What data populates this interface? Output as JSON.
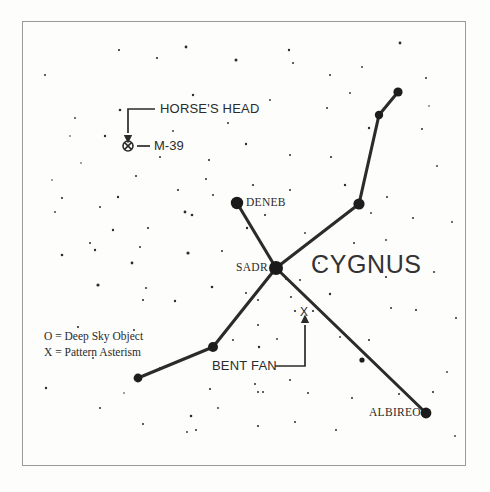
{
  "chart": {
    "title": "CYGNUS",
    "frame": {
      "x": 22,
      "y": 21,
      "width": 443,
      "height": 444,
      "color": "#9a9a9a"
    },
    "background_color": "#fdfdfc",
    "ink_color": "#2b2b2b"
  },
  "legend": {
    "line1": "O = Deep Sky Object",
    "line2": "X = Pattern Asterism"
  },
  "labels": {
    "cygnus": "CYGNUS",
    "deneb": "DENEB",
    "sadr": "SADR",
    "albireo": "ALBIREO",
    "m39": "M-39",
    "horses_head": "HORSE'S HEAD",
    "bent_fan": "BENT FAN",
    "asterism_marker": "X"
  },
  "chart_data": {
    "type": "scatter",
    "title": "CYGNUS",
    "xlabel": "",
    "ylabel": "",
    "xlim": [
      0,
      490
    ],
    "ylim": [
      0,
      492
    ],
    "grid": false,
    "legend_position": "lower-left",
    "named_stars": [
      {
        "name": "DENEB",
        "x": 237,
        "y": 203,
        "radius": 6.2
      },
      {
        "name": "SADR",
        "x": 276,
        "y": 268,
        "radius": 7.0
      },
      {
        "name": "ALBIREO",
        "x": 426,
        "y": 413,
        "radius": 5.4
      }
    ],
    "pattern_stars": [
      {
        "name": "wing-tip-ne",
        "x": 398,
        "y": 92,
        "radius": 4.6
      },
      {
        "name": "wing-bend-ne",
        "x": 379,
        "y": 115,
        "radius": 4.2
      },
      {
        "name": "wing-joint-ne",
        "x": 359,
        "y": 204,
        "radius": 5.6
      },
      {
        "name": "wing-mid-sw",
        "x": 213,
        "y": 347,
        "radius": 5.0
      },
      {
        "name": "wing-tip-sw",
        "x": 138,
        "y": 378,
        "radius": 4.4
      },
      {
        "name": "tail-mid-se",
        "x": 362,
        "y": 360,
        "radius": 2.6
      }
    ],
    "pattern_lines": [
      {
        "name": "deneb-to-sadr",
        "x1": 237,
        "y1": 203,
        "x2": 276,
        "y2": 268
      },
      {
        "name": "sadr-to-wing-ne",
        "x1": 276,
        "y1": 268,
        "x2": 359,
        "y2": 204
      },
      {
        "name": "wing-ne-to-bend",
        "x1": 359,
        "y1": 204,
        "x2": 379,
        "y2": 115
      },
      {
        "name": "bend-to-wing-tip",
        "x1": 379,
        "y1": 115,
        "x2": 398,
        "y2": 92
      },
      {
        "name": "sadr-to-albireo",
        "x1": 276,
        "y1": 268,
        "x2": 426,
        "y2": 413
      },
      {
        "name": "sadr-to-wing-sw",
        "x1": 276,
        "y1": 268,
        "x2": 213,
        "y2": 347
      },
      {
        "name": "wing-sw-to-tip",
        "x1": 213,
        "y1": 347,
        "x2": 138,
        "y2": 378
      }
    ],
    "deep_sky_objects": [
      {
        "name": "M-39",
        "x": 128,
        "y": 146,
        "radius": 5.0,
        "symbol": "circle-with-x"
      }
    ],
    "asterism_markers": [
      {
        "name": "BENT FAN",
        "x": 304,
        "y": 312,
        "symbol": "X"
      }
    ],
    "annotations": [
      {
        "name": "horses-head-callout",
        "text": "HORSE'S HEAD",
        "text_x": 160,
        "text_y": 104,
        "leader": [
          [
            155,
            109
          ],
          [
            128,
            109
          ],
          [
            128,
            133
          ]
        ],
        "arrow_at": [
          128,
          136
        ],
        "arrow_dir": "down"
      },
      {
        "name": "m39-callout",
        "text": "M-39",
        "text_x": 154,
        "text_y": 139,
        "leader": [
          [
            137,
            146
          ],
          [
            150,
            146
          ]
        ],
        "arrow_at": null
      },
      {
        "name": "bent-fan-callout",
        "text": "BENT FAN",
        "text_x": 212,
        "text_y": 359,
        "leader": [
          [
            275,
            366
          ],
          [
            305,
            366
          ],
          [
            305,
            325
          ]
        ],
        "arrow_at": [
          305,
          322
        ],
        "arrow_dir": "up"
      }
    ],
    "background_stars": [
      {
        "x": 45,
        "y": 75,
        "r": 1.0
      },
      {
        "x": 75,
        "y": 118,
        "r": 0.9
      },
      {
        "x": 119,
        "y": 50,
        "r": 1.1
      },
      {
        "x": 136,
        "y": 176,
        "r": 1.0
      },
      {
        "x": 62,
        "y": 198,
        "r": 1.1
      },
      {
        "x": 52,
        "y": 180,
        "r": 0.8
      },
      {
        "x": 100,
        "y": 207,
        "r": 1.0
      },
      {
        "x": 105,
        "y": 136,
        "r": 1.2
      },
      {
        "x": 120,
        "y": 110,
        "r": 1.3
      },
      {
        "x": 157,
        "y": 58,
        "r": 1.1
      },
      {
        "x": 186,
        "y": 47,
        "r": 1.4
      },
      {
        "x": 236,
        "y": 60,
        "r": 1.5
      },
      {
        "x": 289,
        "y": 50,
        "r": 1.2
      },
      {
        "x": 330,
        "y": 75,
        "r": 1.0
      },
      {
        "x": 400,
        "y": 43,
        "r": 1.4
      },
      {
        "x": 426,
        "y": 78,
        "r": 1.0
      },
      {
        "x": 422,
        "y": 129,
        "r": 1.0
      },
      {
        "x": 437,
        "y": 166,
        "r": 0.9
      },
      {
        "x": 293,
        "y": 63,
        "r": 1.0
      },
      {
        "x": 327,
        "y": 108,
        "r": 1.0
      },
      {
        "x": 270,
        "y": 100,
        "r": 0.9
      },
      {
        "x": 193,
        "y": 95,
        "r": 1.2
      },
      {
        "x": 160,
        "y": 157,
        "r": 1.0
      },
      {
        "x": 209,
        "y": 160,
        "r": 1.1
      },
      {
        "x": 246,
        "y": 144,
        "r": 1.2
      },
      {
        "x": 290,
        "y": 155,
        "r": 1.0
      },
      {
        "x": 331,
        "y": 157,
        "r": 1.1
      },
      {
        "x": 290,
        "y": 190,
        "r": 1.0
      },
      {
        "x": 345,
        "y": 185,
        "r": 1.2
      },
      {
        "x": 253,
        "y": 185,
        "r": 1.1
      },
      {
        "x": 213,
        "y": 195,
        "r": 1.0
      },
      {
        "x": 178,
        "y": 190,
        "r": 1.1
      },
      {
        "x": 118,
        "y": 197,
        "r": 1.2
      },
      {
        "x": 113,
        "y": 230,
        "r": 1.2
      },
      {
        "x": 148,
        "y": 228,
        "r": 1.1
      },
      {
        "x": 185,
        "y": 212,
        "r": 1.4
      },
      {
        "x": 192,
        "y": 215,
        "r": 1.3
      },
      {
        "x": 206,
        "y": 179,
        "r": 1.0
      },
      {
        "x": 62,
        "y": 255,
        "r": 1.3
      },
      {
        "x": 90,
        "y": 243,
        "r": 1.0
      },
      {
        "x": 98,
        "y": 285,
        "r": 1.6
      },
      {
        "x": 132,
        "y": 263,
        "r": 1.4
      },
      {
        "x": 143,
        "y": 300,
        "r": 1.1
      },
      {
        "x": 188,
        "y": 253,
        "r": 1.6
      },
      {
        "x": 175,
        "y": 301,
        "r": 1.2
      },
      {
        "x": 212,
        "y": 287,
        "r": 1.3
      },
      {
        "x": 222,
        "y": 251,
        "r": 1.0
      },
      {
        "x": 247,
        "y": 228,
        "r": 1.2
      },
      {
        "x": 258,
        "y": 300,
        "r": 1.0
      },
      {
        "x": 300,
        "y": 280,
        "r": 1.0
      },
      {
        "x": 330,
        "y": 294,
        "r": 1.2
      },
      {
        "x": 386,
        "y": 277,
        "r": 1.1
      },
      {
        "x": 434,
        "y": 272,
        "r": 1.0
      },
      {
        "x": 391,
        "y": 308,
        "r": 1.0
      },
      {
        "x": 416,
        "y": 310,
        "r": 1.1
      },
      {
        "x": 369,
        "y": 340,
        "r": 1.1
      },
      {
        "x": 340,
        "y": 337,
        "r": 0.9
      },
      {
        "x": 291,
        "y": 297,
        "r": 1.0
      },
      {
        "x": 246,
        "y": 293,
        "r": 1.0
      },
      {
        "x": 233,
        "y": 340,
        "r": 1.0
      },
      {
        "x": 258,
        "y": 325,
        "r": 1.0
      },
      {
        "x": 277,
        "y": 339,
        "r": 0.9
      },
      {
        "x": 95,
        "y": 250,
        "r": 1.2
      },
      {
        "x": 140,
        "y": 247,
        "r": 1.0
      },
      {
        "x": 146,
        "y": 288,
        "r": 1.0
      },
      {
        "x": 78,
        "y": 327,
        "r": 1.1
      },
      {
        "x": 93,
        "y": 358,
        "r": 0.9
      },
      {
        "x": 46,
        "y": 388,
        "r": 1.2
      },
      {
        "x": 134,
        "y": 330,
        "r": 1.0
      },
      {
        "x": 160,
        "y": 368,
        "r": 1.0
      },
      {
        "x": 191,
        "y": 416,
        "r": 1.3
      },
      {
        "x": 196,
        "y": 430,
        "r": 1.0
      },
      {
        "x": 187,
        "y": 432,
        "r": 0.9
      },
      {
        "x": 143,
        "y": 424,
        "r": 1.0
      },
      {
        "x": 100,
        "y": 408,
        "r": 1.0
      },
      {
        "x": 210,
        "y": 389,
        "r": 1.1
      },
      {
        "x": 255,
        "y": 384,
        "r": 1.0
      },
      {
        "x": 263,
        "y": 392,
        "r": 1.0
      },
      {
        "x": 258,
        "y": 426,
        "r": 1.1
      },
      {
        "x": 295,
        "y": 422,
        "r": 1.0
      },
      {
        "x": 290,
        "y": 380,
        "r": 1.0
      },
      {
        "x": 259,
        "y": 347,
        "r": 1.2
      },
      {
        "x": 258,
        "y": 392,
        "r": 1.0
      },
      {
        "x": 308,
        "y": 393,
        "r": 1.0
      },
      {
        "x": 352,
        "y": 398,
        "r": 1.0
      },
      {
        "x": 336,
        "y": 430,
        "r": 1.0
      },
      {
        "x": 399,
        "y": 394,
        "r": 1.0
      },
      {
        "x": 433,
        "y": 392,
        "r": 1.1
      },
      {
        "x": 455,
        "y": 436,
        "r": 0.9
      },
      {
        "x": 447,
        "y": 372,
        "r": 0.9
      },
      {
        "x": 413,
        "y": 218,
        "r": 1.0
      },
      {
        "x": 452,
        "y": 222,
        "r": 0.9
      },
      {
        "x": 456,
        "y": 318,
        "r": 1.0
      },
      {
        "x": 386,
        "y": 240,
        "r": 0.9
      },
      {
        "x": 354,
        "y": 243,
        "r": 1.0
      },
      {
        "x": 305,
        "y": 233,
        "r": 0.9
      },
      {
        "x": 265,
        "y": 215,
        "r": 1.1
      },
      {
        "x": 319,
        "y": 263,
        "r": 1.0
      },
      {
        "x": 286,
        "y": 279,
        "r": 1.0
      },
      {
        "x": 369,
        "y": 128,
        "r": 1.2
      },
      {
        "x": 350,
        "y": 93,
        "r": 0.9
      },
      {
        "x": 362,
        "y": 67,
        "r": 0.9
      },
      {
        "x": 429,
        "y": 106,
        "r": 0.8
      },
      {
        "x": 387,
        "y": 197,
        "r": 1.0
      },
      {
        "x": 371,
        "y": 213,
        "r": 0.9
      },
      {
        "x": 228,
        "y": 123,
        "r": 1.0
      },
      {
        "x": 173,
        "y": 131,
        "r": 0.9
      },
      {
        "x": 70,
        "y": 136,
        "r": 0.8
      },
      {
        "x": 55,
        "y": 212,
        "r": 0.9
      },
      {
        "x": 81,
        "y": 163,
        "r": 0.8
      },
      {
        "x": 218,
        "y": 408,
        "r": 0.9
      },
      {
        "x": 124,
        "y": 393,
        "r": 0.8
      }
    ]
  }
}
